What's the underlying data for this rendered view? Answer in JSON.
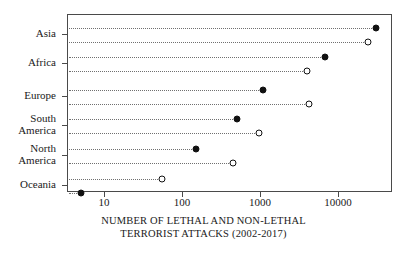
{
  "chart_data": {
    "type": "scatter",
    "title": "",
    "xlabel": "NUMBER OF LETHAL AND NON-LETHAL TERRORIST ATTACKS (2002-2017)",
    "xlabel_line1": "NUMBER OF LETHAL AND NON-LETHAL",
    "xlabel_line2": "TERRORIST ATTACKS (2002-2017)",
    "ylabel": "",
    "xscale": "log",
    "xlim": [
      3.6,
      60000
    ],
    "xticks": [
      10,
      100,
      1000,
      10000
    ],
    "xticklabels": [
      "10",
      "100",
      "1000",
      "10000"
    ],
    "grid": false,
    "leader_lines": "dotted",
    "legend": "none",
    "categories": [
      "Asia",
      "Africa",
      "Europe",
      "South America",
      "North America",
      "Oceania"
    ],
    "series": [
      {
        "name": "Lethal attacks",
        "marker": "filled-circle",
        "color": "#111111",
        "values": [
          31000,
          6800,
          1100,
          500,
          150,
          5
        ]
      },
      {
        "name": "Non-lethal attacks",
        "marker": "open-circle",
        "color": "#111111",
        "values": [
          24000,
          4000,
          4200,
          980,
          450,
          55
        ]
      }
    ],
    "points": [
      {
        "category": "Asia",
        "label_line1": "Asia",
        "label_line2": "",
        "filled": 31000,
        "open": 24000,
        "filled_row": "upper",
        "open_row": "lower"
      },
      {
        "category": "Africa",
        "label_line1": "Africa",
        "label_line2": "",
        "filled": 6800,
        "open": 4000,
        "filled_row": "upper",
        "open_row": "lower"
      },
      {
        "category": "Europe",
        "label_line1": "Europe",
        "label_line2": "",
        "filled": 1100,
        "open": 4200,
        "filled_row": "upper",
        "open_row": "lower"
      },
      {
        "category": "South America",
        "label_line1": "South",
        "label_line2": "America",
        "filled": 500,
        "open": 980,
        "filled_row": "upper",
        "open_row": "lower"
      },
      {
        "category": "North America",
        "label_line1": "North",
        "label_line2": "America",
        "filled": 150,
        "open": 450,
        "filled_row": "upper",
        "open_row": "lower"
      },
      {
        "category": "Oceania",
        "label_line1": "Oceania",
        "label_line2": "",
        "filled": 5,
        "open": 55,
        "filled_row": "lower",
        "open_row": "upper"
      }
    ]
  },
  "axis": {
    "ticks": [
      {
        "value": "10"
      },
      {
        "value": "100"
      },
      {
        "value": "1000"
      },
      {
        "value": "10000"
      }
    ]
  },
  "labels": {
    "asia": "Asia",
    "africa": "Africa",
    "europe": "Europe",
    "south_america_l1": "South",
    "south_america_l2": "America",
    "north_america_l1": "North",
    "north_america_l2": "America",
    "oceania": "Oceania"
  },
  "caption": {
    "line1": "NUMBER OF LETHAL AND NON-LETHAL",
    "line2": "TERRORIST ATTACKS (2002-2017)"
  }
}
